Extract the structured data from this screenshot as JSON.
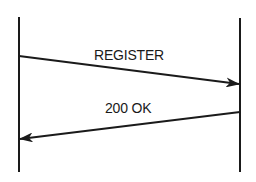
{
  "diagram": {
    "type": "sequence",
    "lifelines": [
      {
        "id": "left",
        "x": 19,
        "y_start": 17,
        "y_end": 172
      },
      {
        "id": "right",
        "x": 240,
        "y_start": 18,
        "y_end": 172
      }
    ],
    "messages": [
      {
        "label": "REGISTER",
        "from": "left",
        "to": "right",
        "x1": 19,
        "y1": 56,
        "x2": 240,
        "y2": 84
      },
      {
        "label": "200 OK",
        "from": "right",
        "to": "left",
        "x1": 240,
        "y1": 112,
        "x2": 19,
        "y2": 139
      }
    ],
    "colors": {
      "stroke": "#1a1a1a",
      "background": "#ffffff"
    }
  }
}
